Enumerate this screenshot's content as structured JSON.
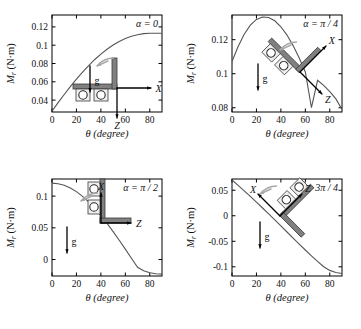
{
  "figure": {
    "name": "restoring-moment-vs-tilt-angle",
    "panel_count": 4,
    "shared": {
      "xlabel": "θ (degree)",
      "ylabel": "M",
      "ylabel_sub": "r",
      "ylabel_unit": " (N·m)",
      "xticks": [
        "0",
        "20",
        "40",
        "60",
        "80"
      ],
      "xtick_values": [
        0,
        20,
        40,
        60,
        80
      ],
      "xlim": [
        0,
        90
      ],
      "curve_color": "#555555",
      "axis_color": "#000000",
      "beam_color": "#808080",
      "arrow_color": "#000000",
      "gray_arrow_color": "#a8a8a8",
      "background": "#ffffff"
    },
    "panels": [
      {
        "id": "panel-alpha-0",
        "annotation": "α = 0",
        "yticks": [
          "0.04",
          "0.06",
          "0.08",
          "0.1",
          "0.12"
        ],
        "ytick_values": [
          0.04,
          0.06,
          0.08,
          0.1,
          0.12
        ],
        "ylim": [
          0.027,
          0.133
        ],
        "diagram": {
          "name": "L-beam-horizontal",
          "beam_rotation_deg": 0,
          "labels": {
            "gravity": "g",
            "x_axis": "X",
            "z_axis": "Z"
          },
          "roller_count": 2
        }
      },
      {
        "id": "panel-alpha-pi-4",
        "annotation": "α = π / 4",
        "yticks": [
          "0.08",
          "0.1",
          "0.12"
        ],
        "ytick_values": [
          0.08,
          0.1,
          0.12
        ],
        "ylim": [
          0.0775,
          0.1345
        ],
        "diagram": {
          "name": "L-beam-tilted-45",
          "beam_rotation_deg": 45,
          "labels": {
            "gravity": "g",
            "x_axis": "X",
            "z_axis": "Z"
          },
          "roller_count": 2
        }
      },
      {
        "id": "panel-alpha-pi-2",
        "annotation": "α = π / 2",
        "yticks": [
          "0",
          "0.05",
          "0.1"
        ],
        "ytick_values": [
          0,
          0.05,
          0.1
        ],
        "ylim": [
          -0.026,
          0.127
        ],
        "diagram": {
          "name": "T-beam-vertical",
          "beam_rotation_deg": 90,
          "labels": {
            "gravity": "g",
            "x_axis": "X",
            "z_axis": "Z"
          },
          "roller_count": 2
        }
      },
      {
        "id": "panel-alpha-3pi-4",
        "annotation": "α = 3π / 4",
        "yticks": [
          "0.05",
          "0",
          "-0.05",
          "-0.1"
        ],
        "ytick_values": [
          0.05,
          0,
          -0.05,
          -0.1
        ],
        "ylim": [
          -0.118,
          0.072
        ],
        "diagram": {
          "name": "V-beam-tilted-135",
          "beam_rotation_deg": 135,
          "labels": {
            "gravity": "g",
            "x_axis": "X",
            "z_axis": "Z"
          },
          "roller_count": 2
        }
      }
    ]
  },
  "chart_data": [
    {
      "type": "line",
      "title": "α = 0",
      "xlabel": "θ (degree)",
      "ylabel": "M_r (N·m)",
      "xlim": [
        0,
        90
      ],
      "ylim": [
        0.027,
        0.133
      ],
      "grid": false,
      "legend": "none",
      "x": [
        0,
        5,
        10,
        15,
        20,
        25,
        30,
        35,
        40,
        45,
        50,
        55,
        60,
        65,
        70,
        75,
        80,
        85,
        90
      ],
      "y": [
        0.028,
        0.0372,
        0.0461,
        0.0547,
        0.0629,
        0.0706,
        0.0778,
        0.0844,
        0.0903,
        0.0956,
        0.1002,
        0.1041,
        0.1073,
        0.1098,
        0.1115,
        0.1126,
        0.113,
        0.1131,
        0.1131
      ]
    },
    {
      "type": "line",
      "title": "α = π / 4",
      "xlabel": "θ (degree)",
      "ylabel": "M_r (N·m)",
      "xlim": [
        0,
        90
      ],
      "ylim": [
        0.0775,
        0.1345
      ],
      "grid": false,
      "legend": "none",
      "x": [
        0,
        5,
        10,
        15,
        20,
        25,
        30,
        35,
        40,
        45,
        50,
        55,
        60,
        65,
        70,
        75,
        80,
        85,
        90
      ],
      "y": [
        0.1072,
        0.116,
        0.1232,
        0.1285,
        0.1319,
        0.1333,
        0.133,
        0.1311,
        0.1276,
        0.1227,
        0.1165,
        0.1092,
        0.101,
        0.0801,
        0.0961,
        0.0931,
        0.0895,
        0.0852,
        0.079
      ]
    },
    {
      "type": "line",
      "title": "α = π / 2",
      "xlabel": "θ (degree)",
      "ylabel": "M_r (N·m)",
      "xlim": [
        0,
        90
      ],
      "ylim": [
        -0.026,
        0.127
      ],
      "grid": false,
      "legend": "none",
      "x": [
        0,
        5,
        10,
        15,
        20,
        25,
        30,
        35,
        40,
        45,
        50,
        55,
        60,
        65,
        70,
        75,
        80,
        85,
        90
      ],
      "y": [
        0.1205,
        0.1196,
        0.1171,
        0.1129,
        0.1071,
        0.0997,
        0.0909,
        0.0808,
        0.0695,
        0.0572,
        0.0441,
        0.0304,
        0.0163,
        0.002,
        -0.0122,
        -0.0178,
        -0.021,
        -0.0225,
        -0.023
      ]
    },
    {
      "type": "line",
      "title": "α = 3π / 4",
      "xlabel": "θ (degree)",
      "ylabel": "M_r (N·m)",
      "xlim": [
        0,
        90
      ],
      "ylim": [
        -0.118,
        0.072
      ],
      "grid": false,
      "legend": "none",
      "x": [
        0,
        5,
        10,
        15,
        20,
        25,
        30,
        35,
        40,
        45,
        50,
        55,
        60,
        65,
        70,
        75,
        80,
        85,
        90
      ],
      "y": [
        0.07,
        0.0595,
        0.0488,
        0.0378,
        0.0266,
        0.0152,
        0.0036,
        -0.0081,
        -0.0199,
        -0.0318,
        -0.0437,
        -0.0555,
        -0.0671,
        -0.0785,
        -0.0895,
        -0.0998,
        -0.107,
        -0.111,
        -0.113
      ]
    }
  ]
}
